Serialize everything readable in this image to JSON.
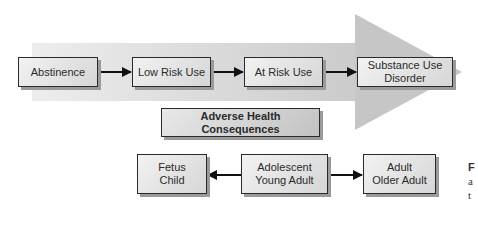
{
  "stages": [
    {
      "id": "abstinence",
      "label": "Abstinence"
    },
    {
      "id": "low-risk-use",
      "label": "Low Risk Use"
    },
    {
      "id": "at-risk-use",
      "label": "At Risk Use"
    },
    {
      "id": "substance-use-disorder",
      "label": "Substance Use\nDisorder"
    }
  ],
  "consequences": {
    "label": "Adverse Health Consequences"
  },
  "lifespan": [
    {
      "id": "fetus-child",
      "label": "Fetus\nChild"
    },
    {
      "id": "adolescent-young-adult",
      "label": "Adolescent\nYoung Adult"
    },
    {
      "id": "adult-older-adult",
      "label": "Adult\nOlder Adult"
    }
  ],
  "side_caption": {
    "lines": [
      "F",
      "a",
      "t"
    ]
  },
  "colors": {
    "band_light": "#ececec",
    "band_dark": "#cdcdcd",
    "arrowhead": "#c4c4c4",
    "connector": "#111111"
  }
}
